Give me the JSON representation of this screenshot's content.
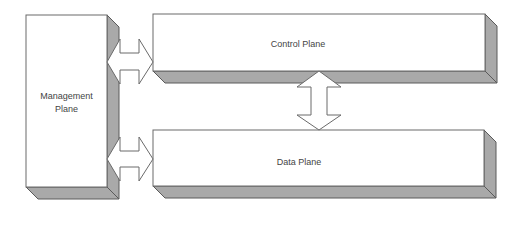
{
  "diagram": {
    "type": "architecture-block-diagram",
    "nodes": [
      {
        "id": "management",
        "label_lines": [
          "Management",
          "Plane"
        ]
      },
      {
        "id": "control",
        "label": "Control Plane"
      },
      {
        "id": "data",
        "label": "Data Plane"
      }
    ],
    "edges": [
      {
        "from": "management",
        "to": "control",
        "style": "bidirectional-block-arrow"
      },
      {
        "from": "management",
        "to": "data",
        "style": "bidirectional-block-arrow"
      },
      {
        "from": "control",
        "to": "data",
        "style": "bidirectional-block-arrow"
      }
    ],
    "colors": {
      "face": "#ffffff",
      "side_shadow": "#a9a9a9",
      "outline": "#6a6a6a",
      "text": "#444444"
    }
  }
}
